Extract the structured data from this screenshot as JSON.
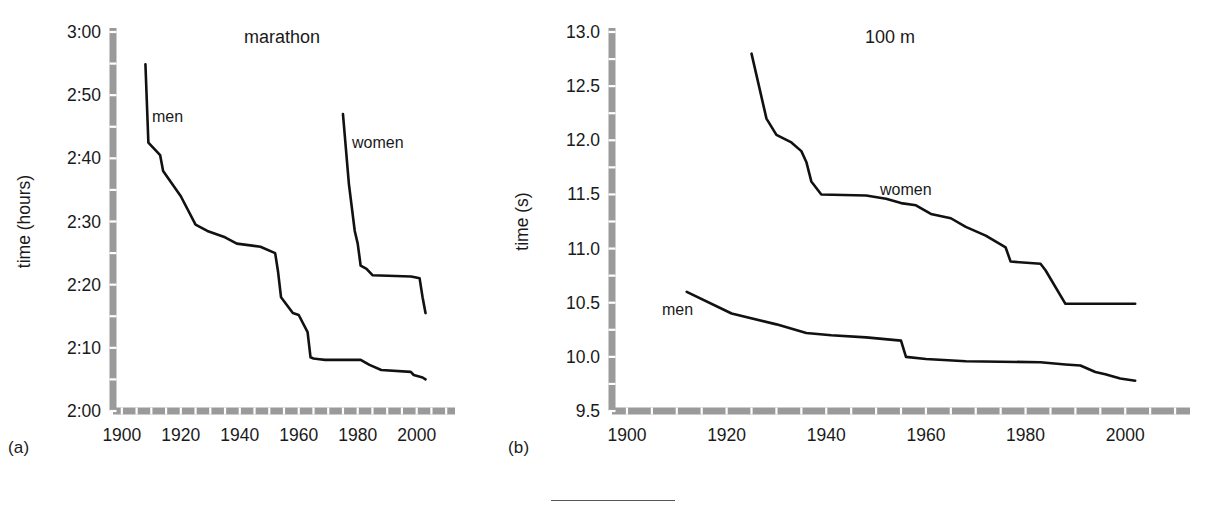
{
  "figure": {
    "panels": [
      {
        "caption": "(a)",
        "title": "marathon",
        "ylabel": "time (hours)",
        "xlabel": "",
        "y_ticks": [
          "2:00",
          "2:10",
          "2:20",
          "2:30",
          "2:40",
          "2:50",
          "3:00"
        ],
        "x_ticks": [
          "1900",
          "1920",
          "1940",
          "1960",
          "1980",
          "2000"
        ],
        "series_labels": [
          "men",
          "women"
        ]
      },
      {
        "caption": "(b)",
        "title": "100 m",
        "ylabel": "time (s)",
        "xlabel": "",
        "y_ticks": [
          "9.5",
          "10.0",
          "10.5",
          "11.0",
          "11.5",
          "12.0",
          "12.5",
          "13.0"
        ],
        "x_ticks": [
          "1900",
          "1920",
          "1940",
          "1960",
          "1980",
          "2000"
        ],
        "series_labels": [
          "women",
          "men"
        ]
      }
    ]
  },
  "colors": {
    "line": "#111111",
    "axis": "#9a9a9a",
    "text": "#1a1a1a",
    "background": "#ffffff"
  },
  "chart_data": [
    {
      "type": "line",
      "title": "marathon",
      "xlabel": "",
      "ylabel": "time (hours)",
      "xlim": [
        1897,
        2013
      ],
      "ylim": [
        120,
        180
      ],
      "ytick_values": [
        120,
        130,
        140,
        150,
        160,
        170,
        180
      ],
      "ytick_labels": [
        "2:00",
        "2:10",
        "2:20",
        "2:30",
        "2:40",
        "2:50",
        "3:00"
      ],
      "xtick_values": [
        1900,
        1920,
        1940,
        1960,
        1980,
        2000
      ],
      "xtick_labels": [
        "1900",
        "1920",
        "1940",
        "1960",
        "1980",
        "2000"
      ],
      "y_units": "minutes",
      "grid": false,
      "legend": "inline-labels",
      "series": [
        {
          "name": "men",
          "label_text": "men",
          "x": [
            1908,
            1909,
            1913,
            1914,
            1920,
            1925,
            1929,
            1935,
            1939,
            1947,
            1952,
            1953,
            1954,
            1958,
            1960,
            1963,
            1964,
            1965,
            1967,
            1969,
            1981,
            1984,
            1988,
            1998,
            1999,
            2002,
            2003
          ],
          "y": [
            174.9,
            162.5,
            160.5,
            158.0,
            154.0,
            149.5,
            148.5,
            147.5,
            146.5,
            146.0,
            145.0,
            142.0,
            138.0,
            135.5,
            135.2,
            132.5,
            128.5,
            128.3,
            128.2,
            128.1,
            128.1,
            127.3,
            126.5,
            126.2,
            125.7,
            125.3,
            125.0
          ]
        },
        {
          "name": "women",
          "label_text": "women",
          "x": [
            1975,
            1977,
            1979,
            1980,
            1981,
            1983,
            1985,
            1998,
            1999,
            2001,
            2002,
            2003
          ],
          "y": [
            167.0,
            156.0,
            148.5,
            146.5,
            143.0,
            142.5,
            141.5,
            141.3,
            141.2,
            141.0,
            138.0,
            135.5
          ]
        }
      ]
    },
    {
      "type": "line",
      "title": "100 m",
      "xlabel": "",
      "ylabel": "time (s)",
      "xlim": [
        1897,
        2013
      ],
      "ylim": [
        9.5,
        13.0
      ],
      "ytick_values": [
        9.5,
        10.0,
        10.5,
        11.0,
        11.5,
        12.0,
        12.5,
        13.0
      ],
      "ytick_labels": [
        "9.5",
        "10.0",
        "10.5",
        "11.0",
        "11.5",
        "12.0",
        "12.5",
        "13.0"
      ],
      "xtick_values": [
        1900,
        1920,
        1940,
        1960,
        1980,
        2000
      ],
      "xtick_labels": [
        "1900",
        "1920",
        "1940",
        "1960",
        "1980",
        "2000"
      ],
      "y_units": "seconds",
      "grid": false,
      "legend": "inline-labels",
      "series": [
        {
          "name": "women",
          "label_text": "women",
          "x": [
            1925,
            1928,
            1930,
            1933,
            1935,
            1936,
            1937,
            1939,
            1948,
            1952,
            1955,
            1958,
            1961,
            1965,
            1968,
            1972,
            1976,
            1977,
            1983,
            1984,
            1988,
            1991,
            2002
          ],
          "y": [
            12.8,
            12.2,
            12.05,
            11.98,
            11.9,
            11.8,
            11.62,
            11.5,
            11.49,
            11.46,
            11.42,
            11.4,
            11.32,
            11.28,
            11.2,
            11.12,
            11.01,
            10.88,
            10.86,
            10.8,
            10.49,
            10.49,
            10.49
          ]
        },
        {
          "name": "men",
          "label_text": "men",
          "x": [
            1912,
            1921,
            1930,
            1936,
            1941,
            1948,
            1955,
            1956,
            1960,
            1968,
            1983,
            1988,
            1991,
            1994,
            1996,
            1999,
            2002
          ],
          "y": [
            10.6,
            10.4,
            10.3,
            10.22,
            10.2,
            10.18,
            10.15,
            10.0,
            9.98,
            9.96,
            9.95,
            9.93,
            9.92,
            9.86,
            9.84,
            9.8,
            9.78
          ]
        }
      ]
    }
  ]
}
